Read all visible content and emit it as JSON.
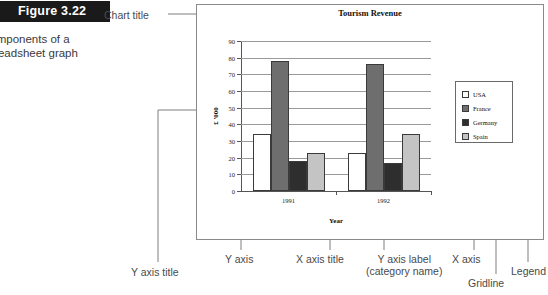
{
  "figure": {
    "tab_label": "Figure 3.22",
    "caption": "Components of a\nspreadsheet graph"
  },
  "annotations": {
    "chart_title": "Chart title",
    "y_axis_title": "Y axis title",
    "y_axis": "Y axis",
    "x_axis_title": "X axis title",
    "y_axis_label": "Y axis label\n(category  name)",
    "x_axis": "X axis",
    "gridline": "Gridline",
    "legend": "Legend"
  },
  "chart_data": {
    "type": "bar",
    "title": "Tourism Revenue",
    "xlabel": "Year",
    "ylabel": "£ '000",
    "categories": [
      "1991",
      "1992"
    ],
    "series": [
      {
        "name": "USA",
        "color": "#ffffff",
        "values": [
          34,
          23
        ]
      },
      {
        "name": "France",
        "color": "#6e6e6e",
        "values": [
          78,
          76
        ]
      },
      {
        "name": "Germany",
        "color": "#2e2e2e",
        "values": [
          18,
          17
        ]
      },
      {
        "name": "Spain",
        "color": "#c4c4c4",
        "values": [
          23,
          34
        ]
      }
    ],
    "ylim": [
      0,
      90
    ],
    "yticks": [
      0,
      10,
      20,
      30,
      40,
      50,
      60,
      70,
      80,
      90
    ],
    "ytick_labels": [
      "0",
      "10",
      "20",
      "30",
      "40",
      "50",
      "60",
      "70",
      "80",
      "90"
    ],
    "grid": true,
    "legend_position": "right"
  }
}
